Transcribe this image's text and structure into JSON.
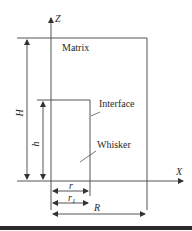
{
  "diagram": {
    "type": "whisker-matrix-geometry",
    "axes": {
      "z_label": "Z",
      "x_label": "X"
    },
    "regions": {
      "matrix_label": "Matrix",
      "interface_label": "Interface",
      "whisker_label": "Whisker"
    },
    "dimensions": {
      "H_label": "H",
      "h_label": "h",
      "r_label": "r",
      "r1_label": "r",
      "r1_subscript": "1",
      "R_label": "R"
    },
    "colors": {
      "line": "#555555",
      "text": "#2a2a2a",
      "bar": "#2b2b2b"
    }
  }
}
